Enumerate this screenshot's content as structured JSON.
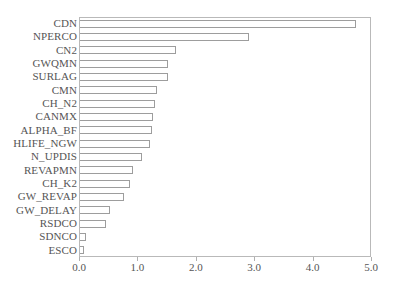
{
  "chart_data": {
    "type": "bar",
    "orientation": "horizontal",
    "title": "",
    "subtitle": "",
    "xlabel": "",
    "ylabel": "",
    "xlim": [
      0.0,
      5.0
    ],
    "xticks": [
      "0.0",
      "1.0",
      "2.0",
      "3.0",
      "4.0",
      "5.0"
    ],
    "xtick_values": [
      0.0,
      1.0,
      2.0,
      3.0,
      4.0,
      5.0
    ],
    "grid": false,
    "legend": null,
    "legend_position": "none",
    "bar_fill_color": "#ffffff",
    "bar_edge_color": "#9d9d9d",
    "axis_color": "#b9b9b9",
    "background_color": "#ffffff",
    "categories": [
      "CDN",
      "NPERCO",
      "CN2",
      "GWQMN",
      "SURLAG",
      "CMN",
      "CH_N2",
      "CANMX",
      "ALPHA_BF",
      "HLIFE_NGW",
      "N_UPDIS",
      "REVAPMN",
      "CH_K2",
      "GW_REVAP",
      "GW_DELAY",
      "RSDCO",
      "SDNCO",
      "ESCO"
    ],
    "values": [
      4.72,
      2.9,
      1.64,
      1.5,
      1.5,
      1.31,
      1.28,
      1.25,
      1.24,
      1.2,
      1.07,
      0.9,
      0.86,
      0.76,
      0.52,
      0.45,
      0.1,
      0.07
    ]
  }
}
